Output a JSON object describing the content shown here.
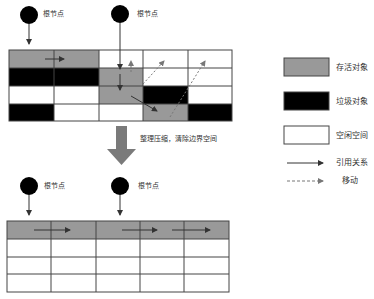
{
  "diagram": {
    "root_label": "根节点",
    "process_label": "整理压缩，清除边界空间",
    "colors": {
      "live": "#999999",
      "garbage": "#000000",
      "free": "#ffffff",
      "grid_line": "#444444",
      "arrow": "#333333",
      "big_arrow": "#7a7a7a"
    },
    "before": {
      "columns": 5,
      "rows": 4,
      "cells": [
        [
          "live",
          "live",
          "free",
          "free",
          "free"
        ],
        [
          "garbage",
          "garbage",
          "live",
          "free",
          "free"
        ],
        [
          "free",
          "free",
          "live",
          "garbage",
          "free"
        ],
        [
          "garbage",
          "free",
          "free",
          "live",
          "garbage"
        ]
      ],
      "roots": [
        {
          "label": "根节点"
        },
        {
          "label": "根节点"
        }
      ]
    },
    "after": {
      "columns": 5,
      "rows": 4,
      "cells": [
        [
          "live",
          "live",
          "live",
          "live",
          "live"
        ],
        [
          "free",
          "free",
          "free",
          "free",
          "free"
        ],
        [
          "free",
          "free",
          "free",
          "free",
          "free"
        ],
        [
          "free",
          "free",
          "free",
          "free",
          "free"
        ]
      ],
      "roots": [
        {
          "label": "根节点"
        },
        {
          "label": "根节点"
        }
      ]
    }
  },
  "legend": {
    "items": [
      {
        "type": "live",
        "label": "存活对象"
      },
      {
        "type": "garbage",
        "label": "垃圾对象"
      },
      {
        "type": "free",
        "label": "空闲空间"
      },
      {
        "type": "reference",
        "label": "引用关系"
      },
      {
        "type": "move",
        "label": "移动"
      }
    ]
  }
}
